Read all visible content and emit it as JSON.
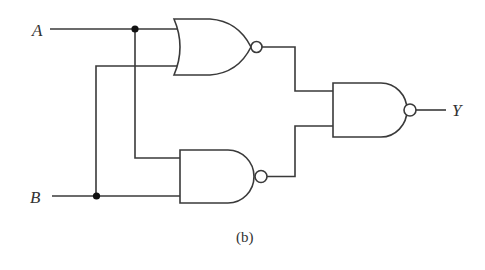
{
  "diagram": {
    "type": "logic-circuit",
    "caption": "(b)",
    "inputs": [
      {
        "label": "A"
      },
      {
        "label": "B"
      }
    ],
    "output": {
      "label": "Y"
    },
    "gates": [
      {
        "id": "g1",
        "type": "NOR",
        "inputs": [
          "A",
          "B"
        ]
      },
      {
        "id": "g2",
        "type": "NAND",
        "inputs": [
          "A",
          "B"
        ]
      },
      {
        "id": "g3",
        "type": "NAND",
        "inputs": [
          "g1",
          "g2"
        ],
        "output": "Y"
      }
    ],
    "junctions": [
      "A",
      "B"
    ],
    "colors": {
      "line": "#3a3a3a",
      "dot": "#111111",
      "background": "#ffffff"
    }
  }
}
